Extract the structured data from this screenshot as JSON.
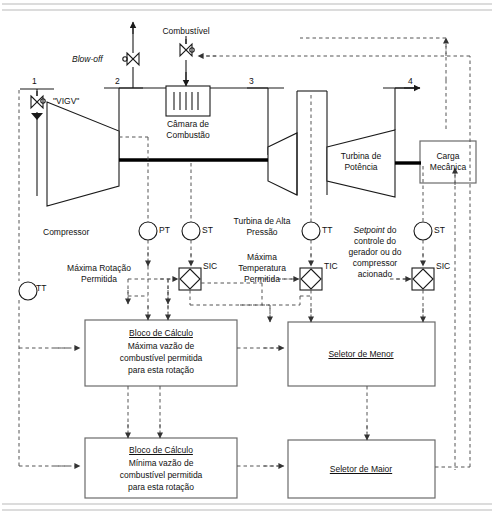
{
  "diagram": {
    "title_alt": "Diagrama de controle de turbina a gás",
    "stations": {
      "s1": "1",
      "s2": "2",
      "s3": "3",
      "s4": "4"
    },
    "streams": {
      "blow_off": "Blow-off",
      "fuel": "Combustível"
    },
    "equipment": {
      "compressor": "Compressor",
      "vigv": "\"VIGV\"",
      "combustor_line1": "Câmara de",
      "combustor_line2": "Combustão",
      "hp_turbine_line1": "Turbina de Alta",
      "hp_turbine_line2": "Pressão",
      "power_turbine_line1": "Turbina de",
      "power_turbine_line2": "Potência",
      "mech_load_line1": "Carga",
      "mech_load_line2": "Mecânica"
    },
    "instruments": {
      "tt_left": "TT",
      "pt": "PT",
      "st_compressor": "ST",
      "tt_hp": "TT",
      "st_power": "ST",
      "sic_left": "SIC",
      "tic": "TIC",
      "sic_right": "SIC"
    },
    "setpoints": {
      "max_speed_line1": "Máxima Rotação",
      "max_speed_line2": "Permitida",
      "max_temp_line1": "Máxima",
      "max_temp_line2": "Temperatura",
      "max_temp_line3": "Permitida",
      "gen_sp_line1": "Setpoint",
      "gen_sp_line1b": " do",
      "gen_sp_line2": "controle do",
      "gen_sp_line3": "gerador ou do",
      "gen_sp_line4": "compressor",
      "gen_sp_line5": "acionado"
    },
    "blocks": {
      "calc_max": {
        "title": "Bloco de Cálculo",
        "line1": "Máxima vazão de",
        "line2": "combustível permitida",
        "line3": "para esta rotação"
      },
      "calc_min": {
        "title": "Bloco de Cálculo",
        "line1": "Mínima vazão de",
        "line2": "combustível permitida",
        "line3": "para esta rotação"
      },
      "low_selector": "Seletor de Menor",
      "high_selector": "Seletor de Maior"
    },
    "colors": {
      "line": "#1a1a1a",
      "signal": "#555555",
      "shaft": "#000000",
      "border": "#6b6b6b",
      "background": "#ffffff",
      "rule": "#b9b9b9"
    }
  }
}
